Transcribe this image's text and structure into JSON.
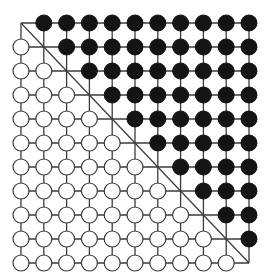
{
  "diagram": {
    "type": "lattice-grid",
    "rows": 11,
    "cols": 11,
    "origin": {
      "x": 21,
      "y": 23
    },
    "spacing": {
      "x": 22.8,
      "y": 24.0
    },
    "node_radius": 8,
    "diagonal": {
      "from": [
        0,
        0
      ],
      "to": [
        10,
        10
      ]
    },
    "rule": "row < col → black node; row > col → white node; row == col → bare intersection",
    "colors": {
      "black_node": "#141414",
      "white_node": "#ffffff",
      "line": "#3a3a3a",
      "background": "#ffffff"
    },
    "counts": {
      "black_nodes": 55,
      "white_nodes": 55,
      "bare_diagonal_points": 11
    }
  }
}
